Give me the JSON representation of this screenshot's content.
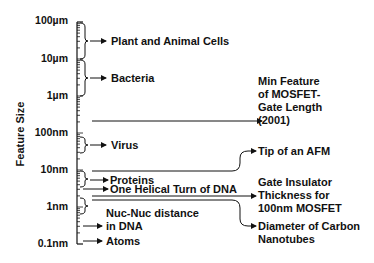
{
  "diagram": {
    "axis_label": "Feature Size",
    "scale": "logarithmic",
    "ticks": [
      "100µm",
      "10µm",
      "1µm",
      "100nm",
      "10nm",
      "1nm",
      "0.1nm"
    ],
    "left_items": [
      {
        "label": "Plant and Animal Cells",
        "range": "10µm–100µm"
      },
      {
        "label": "Bacteria",
        "range": "1µm–10µm"
      },
      {
        "label": "Virus",
        "range": "~100nm"
      },
      {
        "label": "Proteins",
        "range": "~5–10nm"
      },
      {
        "label": "One Helical Turn of DNA",
        "range": "~3nm"
      },
      {
        "label_line1": "Nuc-Nuc distance",
        "label_line2": "in DNA",
        "range": "~0.3nm"
      },
      {
        "label": "Atoms",
        "range": "~0.1nm"
      }
    ],
    "right_items": [
      {
        "line1": "Min Feature",
        "line2": "of MOSFET-",
        "line3": "Gate Length",
        "line4": "(2001)",
        "value": "~130nm"
      },
      {
        "line1": "Tip of an AFM",
        "value": "~10nm"
      },
      {
        "line1": "Gate Insulator",
        "line2": "Thickness for",
        "line3": "100nm MOSFET",
        "value": "~1.5nm"
      },
      {
        "line1": "Diameter of Carbon",
        "line2": "Nanotubes",
        "value": "~1nm"
      }
    ]
  }
}
